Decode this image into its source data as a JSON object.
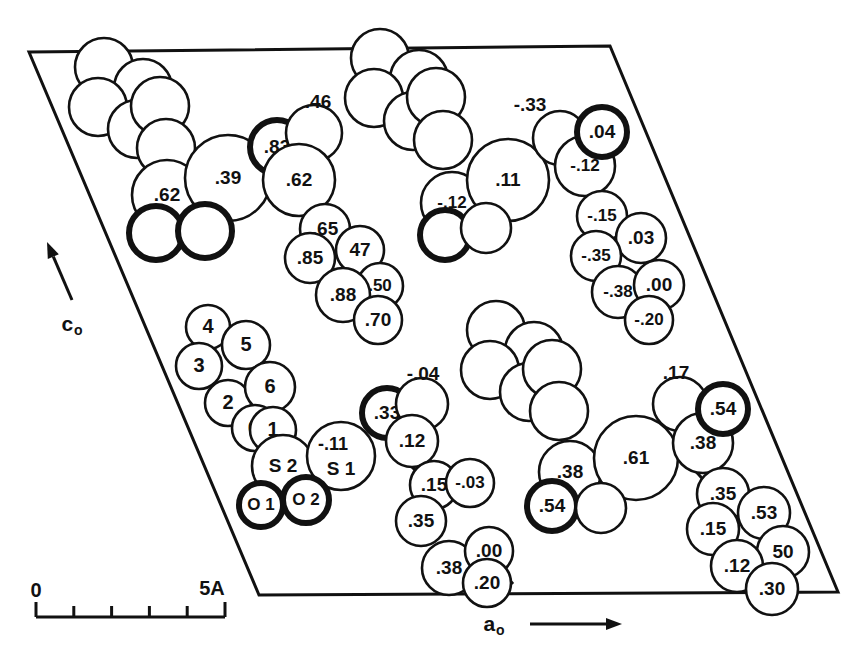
{
  "figure": {
    "kind": "crystal-structure-projection",
    "width": 864,
    "height": 666,
    "background": "#ffffff",
    "ink": "#111111"
  },
  "unit_cell": {
    "name": "unit-cell-parallelogram",
    "corners": [
      [
        29,
        52
      ],
      [
        610,
        46
      ],
      [
        838,
        592
      ],
      [
        259,
        595
      ]
    ],
    "stroke_width": 3
  },
  "axes": {
    "c_axis": {
      "label": "c",
      "subscript": "o",
      "label_x": 72,
      "label_y": 325,
      "arrow_from": [
        72,
        300
      ],
      "arrow_to": [
        47,
        242
      ]
    },
    "a_axis": {
      "label": "a",
      "subscript": "o",
      "label_x": 494,
      "label_y": 625,
      "arrow_from": [
        530,
        624
      ],
      "arrow_to": [
        622,
        624
      ]
    }
  },
  "scale_bar": {
    "name": "scale-bar",
    "start_label": "0",
    "end_label": "5A",
    "x_start": 36,
    "x_end": 225,
    "y_baseline": 617,
    "tick_count": 4,
    "start_label_x": 36,
    "start_label_y": 592,
    "end_label_x": 212,
    "end_label_y": 590
  },
  "atoms": [
    {
      "id": "a01",
      "x": 104,
      "y": 67,
      "r": 29,
      "w": "thin",
      "label": ""
    },
    {
      "id": "a02",
      "x": 143,
      "y": 88,
      "r": 29,
      "w": "thin",
      "label": ""
    },
    {
      "id": "a03",
      "x": 98,
      "y": 107,
      "r": 29,
      "w": "thin",
      "label": ""
    },
    {
      "id": "a04",
      "x": 137,
      "y": 129,
      "r": 29,
      "w": "thin",
      "label": ""
    },
    {
      "id": "a05",
      "x": 160,
      "y": 106,
      "r": 29,
      "w": "thin",
      "label": ""
    },
    {
      "id": "a06",
      "x": 166,
      "y": 148,
      "r": 29,
      "w": "thin",
      "label": ""
    },
    {
      "id": "a07",
      "x": 167,
      "y": 195,
      "r": 35,
      "w": "thin",
      "label": ".62"
    },
    {
      "id": "a08",
      "x": 228,
      "y": 178,
      "r": 43,
      "w": "thin",
      "label": ".39"
    },
    {
      "id": "a09",
      "x": 156,
      "y": 233,
      "r": 27,
      "w": "bold",
      "label": ""
    },
    {
      "id": "a10",
      "x": 205,
      "y": 231,
      "r": 27,
      "w": "bold",
      "label": ""
    },
    {
      "id": "a11",
      "x": 277,
      "y": 147,
      "r": 27,
      "w": "bold",
      "label": ".83"
    },
    {
      "id": "a12",
      "x": 314,
      "y": 133,
      "r": 28,
      "w": "thin",
      "label": ""
    },
    {
      "id": "a13",
      "x": 299,
      "y": 180,
      "r": 36,
      "w": "thin",
      "label": ".62"
    },
    {
      "id": "a14",
      "x": 325,
      "y": 229,
      "r": 25,
      "w": "thin",
      "label": ".65"
    },
    {
      "id": "a15",
      "x": 310,
      "y": 258,
      "r": 25,
      "w": "thin",
      "label": ".85"
    },
    {
      "id": "a16",
      "x": 360,
      "y": 250,
      "r": 24,
      "w": "thin",
      "label": "47"
    },
    {
      "id": "a17",
      "x": 380,
      "y": 286,
      "r": 23,
      "w": "thin",
      "label": ".50"
    },
    {
      "id": "a18",
      "x": 343,
      "y": 295,
      "r": 27,
      "w": "thin",
      "label": ".88"
    },
    {
      "id": "a19",
      "x": 378,
      "y": 320,
      "r": 24,
      "w": "thin",
      "label": ".70"
    },
    {
      "id": "a20",
      "x": 380,
      "y": 58,
      "r": 29,
      "w": "thin",
      "label": ""
    },
    {
      "id": "a21",
      "x": 419,
      "y": 79,
      "r": 29,
      "w": "thin",
      "label": ""
    },
    {
      "id": "a22",
      "x": 374,
      "y": 98,
      "r": 29,
      "w": "thin",
      "label": ""
    },
    {
      "id": "a23",
      "x": 413,
      "y": 121,
      "r": 29,
      "w": "thin",
      "label": ""
    },
    {
      "id": "a24",
      "x": 436,
      "y": 97,
      "r": 29,
      "w": "thin",
      "label": ""
    },
    {
      "id": "a25",
      "x": 443,
      "y": 140,
      "r": 29,
      "w": "thin",
      "label": ""
    },
    {
      "id": "a26",
      "x": 452,
      "y": 203,
      "r": 31,
      "w": "thin",
      "label": "-.12"
    },
    {
      "id": "a27",
      "x": 508,
      "y": 180,
      "r": 41,
      "w": "thin",
      "label": ".11"
    },
    {
      "id": "a28",
      "x": 560,
      "y": 138,
      "r": 27,
      "w": "thin",
      "label": ""
    },
    {
      "id": "a29",
      "x": 585,
      "y": 166,
      "r": 30,
      "w": "thin",
      "label": "-.12"
    },
    {
      "id": "a30",
      "x": 602,
      "y": 132,
      "r": 25,
      "w": "bold",
      "label": ".04"
    },
    {
      "id": "a31",
      "x": 445,
      "y": 235,
      "r": 25,
      "w": "bold",
      "label": ""
    },
    {
      "id": "a32",
      "x": 486,
      "y": 228,
      "r": 25,
      "w": "thin",
      "label": ""
    },
    {
      "id": "a33",
      "x": 602,
      "y": 216,
      "r": 25,
      "w": "thin",
      "label": "-.15"
    },
    {
      "id": "a34",
      "x": 641,
      "y": 238,
      "r": 25,
      "w": "thin",
      "label": ".03"
    },
    {
      "id": "a35",
      "x": 596,
      "y": 256,
      "r": 25,
      "w": "thin",
      "label": "-.35"
    },
    {
      "id": "a36",
      "x": 618,
      "y": 292,
      "r": 26,
      "w": "thin",
      "label": "-.38"
    },
    {
      "id": "a37",
      "x": 659,
      "y": 285,
      "r": 25,
      "w": "thin",
      "label": ".00"
    },
    {
      "id": "a38",
      "x": 649,
      "y": 320,
      "r": 24,
      "w": "thin",
      "label": "-.20"
    },
    {
      "id": "a39",
      "x": 208,
      "y": 327,
      "r": 22,
      "w": "thin",
      "label": "4"
    },
    {
      "id": "a40",
      "x": 246,
      "y": 345,
      "r": 24,
      "w": "thin",
      "label": "5"
    },
    {
      "id": "a41",
      "x": 199,
      "y": 366,
      "r": 23,
      "w": "thin",
      "label": "3"
    },
    {
      "id": "a42",
      "x": 228,
      "y": 403,
      "r": 23,
      "w": "thin",
      "label": "2"
    },
    {
      "id": "a43",
      "x": 270,
      "y": 387,
      "r": 25,
      "w": "thin",
      "label": "6"
    },
    {
      "id": "a44",
      "x": 255,
      "y": 428,
      "r": 23,
      "w": "thin",
      "label": "C"
    },
    {
      "id": "a45",
      "x": 273,
      "y": 430,
      "r": 23,
      "w": "thin",
      "label": "1"
    },
    {
      "id": "a46",
      "x": 283,
      "y": 466,
      "r": 31,
      "w": "thin",
      "label": "S 2"
    },
    {
      "id": "a47",
      "x": 341,
      "y": 456,
      "r": 34,
      "w": "thin",
      "label": "S 1"
    },
    {
      "id": "a48",
      "x": 261,
      "y": 505,
      "r": 22,
      "w": "bold",
      "label": "O 1"
    },
    {
      "id": "a49",
      "x": 306,
      "y": 500,
      "r": 23,
      "w": "bold",
      "label": "O 2"
    },
    {
      "id": "a50",
      "x": 387,
      "y": 413,
      "r": 25,
      "w": "bold",
      "label": ".33"
    },
    {
      "id": "a51",
      "x": 422,
      "y": 404,
      "r": 26,
      "w": "thin",
      "label": ""
    },
    {
      "id": "a52",
      "x": 412,
      "y": 441,
      "r": 26,
      "w": "thin",
      "label": ".12"
    },
    {
      "id": "a53",
      "x": 434,
      "y": 485,
      "r": 24,
      "w": "thin",
      "label": ".15"
    },
    {
      "id": "a54",
      "x": 470,
      "y": 483,
      "r": 24,
      "w": "thin",
      "label": "-.03"
    },
    {
      "id": "a55",
      "x": 421,
      "y": 521,
      "r": 25,
      "w": "thin",
      "label": ".35"
    },
    {
      "id": "a56",
      "x": 449,
      "y": 568,
      "r": 27,
      "w": "thin",
      "label": ".38"
    },
    {
      "id": "a57",
      "x": 489,
      "y": 551,
      "r": 24,
      "w": "thin",
      "label": ".00"
    },
    {
      "id": "a58",
      "x": 487,
      "y": 583,
      "r": 24,
      "w": "thin",
      "label": ".20"
    },
    {
      "id": "a59",
      "x": 496,
      "y": 330,
      "r": 29,
      "w": "thin",
      "label": ""
    },
    {
      "id": "a60",
      "x": 534,
      "y": 351,
      "r": 29,
      "w": "thin",
      "label": ""
    },
    {
      "id": "a61",
      "x": 490,
      "y": 370,
      "r": 29,
      "w": "thin",
      "label": ""
    },
    {
      "id": "a62",
      "x": 529,
      "y": 392,
      "r": 29,
      "w": "thin",
      "label": ""
    },
    {
      "id": "a63",
      "x": 552,
      "y": 369,
      "r": 29,
      "w": "thin",
      "label": ""
    },
    {
      "id": "a64",
      "x": 559,
      "y": 411,
      "r": 29,
      "w": "thin",
      "label": ""
    },
    {
      "id": "a65",
      "x": 570,
      "y": 472,
      "r": 31,
      "w": "thin",
      "label": ".38"
    },
    {
      "id": "a66",
      "x": 636,
      "y": 458,
      "r": 42,
      "w": "thin",
      "label": ".61"
    },
    {
      "id": "a67",
      "x": 680,
      "y": 404,
      "r": 27,
      "w": "thin",
      "label": ""
    },
    {
      "id": "a68",
      "x": 703,
      "y": 443,
      "r": 30,
      "w": "thin",
      "label": ".38"
    },
    {
      "id": "a69",
      "x": 723,
      "y": 409,
      "r": 25,
      "w": "bold",
      "label": ".54"
    },
    {
      "id": "a70",
      "x": 552,
      "y": 506,
      "r": 25,
      "w": "bold",
      "label": ".54"
    },
    {
      "id": "a71",
      "x": 601,
      "y": 508,
      "r": 25,
      "w": "thin",
      "label": ""
    },
    {
      "id": "a72",
      "x": 723,
      "y": 494,
      "r": 26,
      "w": "thin",
      "label": ".35"
    },
    {
      "id": "a73",
      "x": 764,
      "y": 513,
      "r": 26,
      "w": "thin",
      "label": ".53"
    },
    {
      "id": "a74",
      "x": 713,
      "y": 529,
      "r": 26,
      "w": "thin",
      "label": ".15"
    },
    {
      "id": "a75",
      "x": 783,
      "y": 552,
      "r": 26,
      "w": "thin",
      "label": "50"
    },
    {
      "id": "a76",
      "x": 737,
      "y": 566,
      "r": 26,
      "w": "thin",
      "label": ".12"
    },
    {
      "id": "a77",
      "x": 772,
      "y": 589,
      "r": 26,
      "w": "thin",
      "label": ".30"
    }
  ],
  "free_labels": [
    {
      "id": "f1",
      "text": ".46",
      "x": 318,
      "y": 103
    },
    {
      "id": "f2",
      "text": "-.33",
      "x": 530,
      "y": 106
    },
    {
      "id": "f3",
      "text": "-.04",
      "x": 423,
      "y": 375
    },
    {
      "id": "f4",
      "text": ".17",
      "x": 676,
      "y": 374
    }
  ],
  "bonds": [
    {
      "from": [
        166,
        172
      ],
      "to": [
        166,
        158
      ]
    },
    {
      "from": [
        300,
        215
      ],
      "to": [
        311,
        206
      ]
    },
    {
      "from": [
        453,
        233
      ],
      "to": [
        449,
        213
      ]
    },
    {
      "from": [
        587,
        195
      ],
      "to": [
        598,
        208
      ]
    },
    {
      "from": [
        262,
        446
      ],
      "to": [
        272,
        452
      ]
    },
    {
      "from": [
        411,
        466
      ],
      "to": [
        422,
        477
      ]
    },
    {
      "from": [
        692,
        467
      ],
      "to": [
        708,
        485
      ]
    },
    {
      "from": [
        513,
        584
      ],
      "to": [
        505,
        575
      ]
    }
  ]
}
